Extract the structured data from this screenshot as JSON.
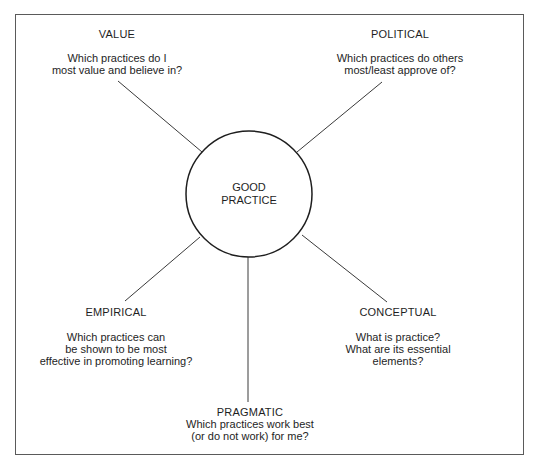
{
  "diagram": {
    "title": "Good practice",
    "center": {
      "lines": [
        "GOOD",
        "PRACTICE"
      ],
      "cx": 249,
      "cy": 194,
      "r": 63
    },
    "nodes": [
      {
        "id": "value",
        "heading": "VALUE",
        "question_lines": [
          "Which practices do I",
          "most value and believe in?"
        ]
      },
      {
        "id": "political",
        "heading": "POLITICAL",
        "question_lines": [
          "Which practices do others",
          "most/least approve of?"
        ]
      },
      {
        "id": "empirical",
        "heading": "EMPIRICAL",
        "question_lines": [
          "Which practices can",
          "be shown to be most",
          "effective in promoting learning?"
        ]
      },
      {
        "id": "conceptual",
        "heading": "CONCEPTUAL",
        "question_lines": [
          "What is practice?",
          "What are its essential",
          "elements?"
        ]
      },
      {
        "id": "pragmatic",
        "heading": "PRAGMATIC",
        "question_lines": [
          "Which practices work best",
          "(or do not work) for me?"
        ]
      }
    ],
    "connectors": [
      {
        "to": "value",
        "x1": 202,
        "y1": 152,
        "x2": 118,
        "y2": 81
      },
      {
        "to": "political",
        "x1": 297,
        "y1": 152,
        "x2": 382,
        "y2": 82
      },
      {
        "to": "empirical",
        "x1": 200,
        "y1": 237,
        "x2": 125,
        "y2": 301
      },
      {
        "to": "conceptual",
        "x1": 302,
        "y1": 235,
        "x2": 387,
        "y2": 302
      },
      {
        "to": "pragmatic",
        "x1": 248,
        "y1": 257,
        "x2": 248,
        "y2": 402
      }
    ],
    "colors": {
      "stroke": "#3a3a3a",
      "circle": "#1e1e1e",
      "frame": "#5a5a5a",
      "text": "#1e1e1e",
      "background": "#ffffff"
    }
  }
}
